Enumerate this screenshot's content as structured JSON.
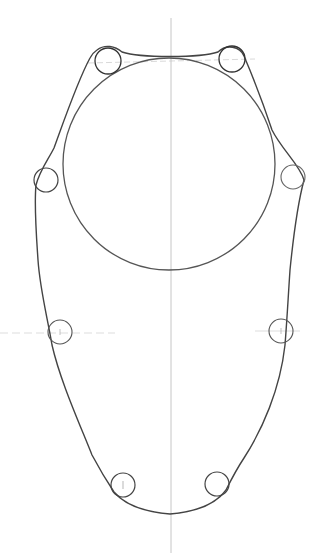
{
  "drawing": {
    "subject": "pencil sketch of a gasket / engine cover outline with large central circle and eight bolt holes",
    "colors": {
      "background": "#ffffff",
      "stroke_dark": "#3a3a3a",
      "stroke_mid": "#6e6e6e",
      "guide_line": "#b8b8b8"
    },
    "center_axis_x": 171,
    "large_circle": {
      "cx": 169,
      "cy": 164,
      "r": 106
    },
    "bolt_holes": [
      {
        "name": "top-left",
        "cx": 108,
        "cy": 61,
        "r": 13
      },
      {
        "name": "top-right",
        "cx": 232,
        "cy": 59,
        "r": 13
      },
      {
        "name": "upper-left",
        "cx": 46,
        "cy": 180,
        "r": 12
      },
      {
        "name": "upper-right",
        "cx": 293,
        "cy": 177,
        "r": 12
      },
      {
        "name": "mid-left",
        "cx": 60,
        "cy": 332,
        "r": 12
      },
      {
        "name": "mid-right",
        "cx": 281,
        "cy": 331,
        "r": 12
      },
      {
        "name": "bottom-left",
        "cx": 123,
        "cy": 485,
        "r": 12
      },
      {
        "name": "bottom-right",
        "cx": 217,
        "cy": 484,
        "r": 12
      }
    ]
  }
}
